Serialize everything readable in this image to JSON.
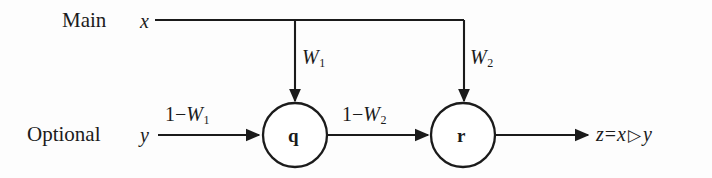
{
  "figure": {
    "type": "block-diagram",
    "background_color": "#fdfdfd",
    "stroke_color": "#1b1b1b",
    "rows": {
      "main_label": "Main",
      "optional_label": "Optional"
    },
    "inputs": {
      "main_signal": "x",
      "optional_signal": "y"
    },
    "weights": {
      "w1": "W",
      "w1_sub": "1",
      "w2": "W",
      "w2_sub": "2",
      "complement_w1_prefix": "1",
      "complement_w1_minus": "−",
      "complement_w1_var": "W",
      "complement_w1_sub": "1",
      "complement_w2_prefix": "1",
      "complement_w2_minus": "−",
      "complement_w2_var": "W",
      "complement_w2_sub": "2"
    },
    "nodes": [
      {
        "id": "q",
        "label": "q",
        "cx": 295,
        "cy": 135,
        "r": 32
      },
      {
        "id": "r",
        "label": "r",
        "cx": 463,
        "cy": 135,
        "r": 32
      }
    ],
    "output": {
      "result_var": "z",
      "equals": "=",
      "left_operand": "x",
      "operator": "▷",
      "right_operand": "y"
    },
    "edges": [
      {
        "from": "x",
        "to": "w1-branch",
        "orientation": "horizontal",
        "arrow": false
      },
      {
        "from": "x",
        "to": "w2-branch",
        "orientation": "horizontal",
        "arrow": false
      },
      {
        "from": "w1-branch",
        "to": "q",
        "orientation": "vertical",
        "arrow": true
      },
      {
        "from": "w2-branch",
        "to": "r",
        "orientation": "vertical",
        "arrow": true
      },
      {
        "from": "y",
        "to": "q",
        "orientation": "horizontal",
        "arrow": true
      },
      {
        "from": "q",
        "to": "r",
        "orientation": "horizontal",
        "arrow": true
      },
      {
        "from": "r",
        "to": "output",
        "orientation": "horizontal",
        "arrow": true
      }
    ]
  }
}
